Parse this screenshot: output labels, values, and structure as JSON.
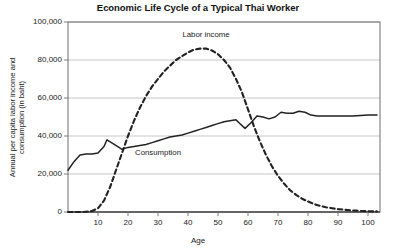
{
  "chart_data": {
    "type": "line",
    "title": "Economic Life Cycle of a Typical Thai Worker",
    "xlabel": "Age",
    "ylabel": "Annual per capita labor income and consumption (in baht)",
    "ylabel_line1": "Annual per capita labor income and",
    "ylabel_line2": "consumption (in baht)",
    "xlim": [
      0,
      104
    ],
    "ylim": [
      0,
      100000
    ],
    "xticks": [
      10,
      20,
      30,
      40,
      50,
      60,
      70,
      80,
      90,
      100
    ],
    "xtick_labels": [
      "10",
      "20",
      "30",
      "40",
      "50",
      "60",
      "70",
      "80",
      "90",
      "100"
    ],
    "yticks": [
      0,
      20000,
      40000,
      60000,
      80000,
      100000
    ],
    "ytick_labels": [
      "0",
      "20,000",
      "40,000",
      "60,000",
      "80,000",
      "100,000"
    ],
    "grid": "horizontal",
    "legend": "inline-annotations",
    "series": [
      {
        "name": "Labor income",
        "style": "dashed",
        "color": "#222222",
        "label_x": 46,
        "label_y": 93000,
        "x": [
          0,
          5,
          8,
          10,
          12,
          14,
          16,
          18,
          20,
          22,
          24,
          26,
          28,
          30,
          32,
          34,
          36,
          38,
          40,
          42,
          44,
          46,
          48,
          50,
          52,
          54,
          56,
          58,
          60,
          62,
          64,
          66,
          68,
          70,
          72,
          74,
          76,
          78,
          80,
          82,
          84,
          86,
          88,
          90,
          92,
          94,
          96,
          98,
          100,
          103
        ],
        "values": [
          0,
          0,
          500,
          2000,
          6000,
          13000,
          22000,
          31000,
          40000,
          48000,
          55000,
          61000,
          66000,
          70000,
          74000,
          77000,
          80000,
          82000,
          84000,
          85500,
          86000,
          86000,
          85000,
          83000,
          80000,
          76000,
          70000,
          63000,
          54000,
          45000,
          37000,
          30000,
          24000,
          19000,
          15000,
          11500,
          9000,
          7000,
          5500,
          4200,
          3200,
          2500,
          2000,
          1500,
          1200,
          900,
          700,
          500,
          400,
          300
        ]
      },
      {
        "name": "Consumption",
        "style": "solid",
        "color": "#222222",
        "label_x": 30,
        "label_y": 31000,
        "x": [
          0,
          2,
          4,
          6,
          8,
          10,
          12,
          13,
          15,
          17,
          18,
          20,
          22,
          24,
          26,
          28,
          30,
          32,
          34,
          36,
          38,
          40,
          42,
          44,
          46,
          48,
          50,
          52,
          54,
          56,
          57,
          59,
          61,
          63,
          65,
          67,
          69,
          71,
          73,
          75,
          77,
          79,
          81,
          83,
          86,
          90,
          95,
          100,
          103
        ],
        "values": [
          22000,
          26500,
          30000,
          30500,
          30500,
          31000,
          34500,
          38000,
          36000,
          34000,
          33000,
          34000,
          34500,
          35000,
          35500,
          36500,
          37500,
          38500,
          39500,
          40000,
          40500,
          41500,
          42500,
          43500,
          44500,
          45500,
          46500,
          47500,
          48000,
          48500,
          47000,
          44000,
          47000,
          50500,
          50000,
          49000,
          50000,
          52500,
          52000,
          52000,
          53000,
          52500,
          51000,
          50500,
          50500,
          50500,
          50500,
          51000,
          51000
        ]
      }
    ]
  }
}
